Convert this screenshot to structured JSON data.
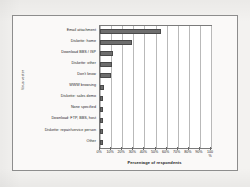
{
  "figure": {
    "frame_color": "#8d8d8d",
    "background_color": "#faf9f8"
  },
  "chart_data": {
    "type": "bar",
    "orientation": "horizontal",
    "title": "",
    "xlabel": "Percentage of respondents",
    "ylabel": "Virus vector",
    "xlim": [
      0,
      100
    ],
    "ylim": null,
    "grid": true,
    "legend": null,
    "bar_color": "#6e6e6e",
    "xunit": "%",
    "xticks": [
      0,
      10,
      20,
      30,
      40,
      50,
      60,
      70,
      80,
      90,
      100
    ],
    "xticklabels": [
      "0%",
      "10%",
      "20%",
      "30%",
      "40%",
      "50%",
      "60%",
      "70%",
      "80%",
      "90%",
      "100\n%"
    ],
    "categories": [
      "Email attachment",
      "Diskette: home",
      "Download BBS / ISP",
      "Diskette: other",
      "Don't know",
      "WWW browsing",
      "Diskette: sales demo",
      "None specified",
      "Download: FTP, BBS, host",
      "Diskette: repair/service person",
      "Other"
    ],
    "values": [
      55,
      29,
      12,
      11,
      10,
      4,
      3,
      3,
      3,
      3,
      3
    ]
  }
}
